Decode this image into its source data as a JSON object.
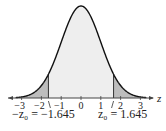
{
  "chart_data": {
    "type": "area",
    "title": "",
    "xlabel": "z",
    "ylabel": "",
    "xlim": [
      -3.3,
      3.3
    ],
    "x_ticks": [
      -3,
      -2,
      -1,
      0,
      1,
      2,
      3
    ],
    "x_tick_labels": [
      "−3",
      "−2",
      "−1",
      "0",
      "1",
      "2",
      "3"
    ],
    "critical_values": [
      -1.645,
      1.645
    ],
    "shaded_regions": [
      {
        "name": "left tail",
        "from": -3.3,
        "to": -1.645
      },
      {
        "name": "right tail",
        "from": 1.645,
        "to": 3.3
      }
    ],
    "annotations": [
      {
        "text": "−z₀ = −1.645",
        "x": -1.645
      },
      {
        "text": "z₀ = 1.645",
        "x": 1.645
      }
    ],
    "colors": {
      "curve": "#111111",
      "center_fill": "#eeeeee",
      "tail_fill": "#bdbdbd",
      "axis": "#444444"
    }
  },
  "labels": {
    "axis_var": "z",
    "left_crit": "−z₀ = −1.645",
    "right_crit": "z₀ = 1.645"
  }
}
